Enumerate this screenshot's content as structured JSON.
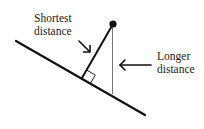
{
  "diagram": {
    "labels": {
      "shortest": [
        "Shortest",
        "distance"
      ],
      "longer": [
        "Longer",
        "distance"
      ]
    },
    "elements": {
      "line": "sloped-line",
      "point": "point",
      "perpendicular": "shortest-distance-segment",
      "vertical": "longer-distance-segment",
      "right_angle": "right-angle-marker"
    },
    "colors": {
      "stroke": "#111111",
      "thin_stroke": "#555555",
      "background": "#ffffff"
    }
  }
}
